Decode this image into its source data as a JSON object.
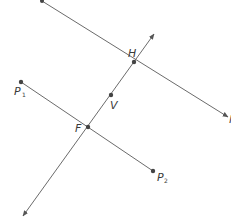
{
  "diagram": {
    "type": "geometry-construction",
    "colors": {
      "line": "#6b6b6b",
      "point": "#444444",
      "label": "#3a3a3a",
      "background": "#ffffff"
    },
    "points": {
      "H": {
        "label": "H",
        "x": 134,
        "y": 62
      },
      "V": {
        "label": "V",
        "x": 111,
        "y": 95
      },
      "F": {
        "label": "F",
        "x": 88,
        "y": 127
      },
      "P1": {
        "label": "P",
        "subscript": "1",
        "x": 21,
        "y": 82
      },
      "P2": {
        "label": "P",
        "subscript": "2",
        "x": 153,
        "y": 171
      }
    },
    "lines": [
      {
        "name": "directrix-line",
        "description": "line through H, ray with arrow at lower right",
        "from": [
          42,
          1
        ],
        "to": [
          229,
          118
        ]
      },
      {
        "name": "axis-line",
        "description": "line through H, V, F with arrows both ends",
        "from": [
          22,
          217
        ],
        "to": [
          155,
          33
        ]
      },
      {
        "name": "segment-p1-p2",
        "description": "segment from P1 to P2 through F",
        "from": [
          21,
          82
        ],
        "to": [
          153,
          171
        ]
      }
    ],
    "edge_label_partial": "l"
  }
}
